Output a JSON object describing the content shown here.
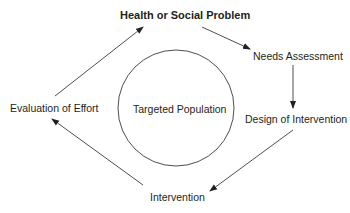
{
  "diagram": {
    "type": "cycle",
    "title": "Health or Social Problem",
    "center": "Targeted Population",
    "nodes": [
      {
        "id": "problem",
        "label": "Health or Social Problem"
      },
      {
        "id": "needs",
        "label": "Needs Assessment"
      },
      {
        "id": "design",
        "label": "Design of Intervention"
      },
      {
        "id": "intervention",
        "label": "Intervention"
      },
      {
        "id": "evaluation",
        "label": "Evaluation of Effort"
      }
    ],
    "edges": [
      {
        "from": "problem",
        "to": "needs"
      },
      {
        "from": "needs",
        "to": "design"
      },
      {
        "from": "design",
        "to": "intervention"
      },
      {
        "from": "intervention",
        "to": "evaluation"
      },
      {
        "from": "evaluation",
        "to": "problem"
      }
    ]
  },
  "colors": {
    "stroke": "#231f20",
    "background": "#ffffff"
  }
}
